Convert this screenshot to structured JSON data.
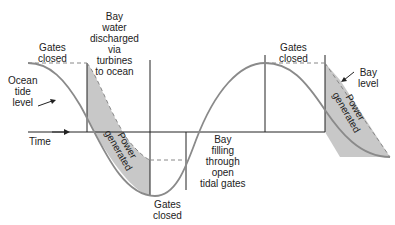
{
  "diagram": {
    "colors": {
      "curve": "#8a8a8a",
      "shading": "#c8c8c8",
      "lines": "#222222",
      "dashed": "#888888"
    },
    "labels": {
      "gates_closed_1": "Gates\nclosed",
      "bay_water": "Bay\nwater\ndischarged\nvia\nturbines\nto ocean",
      "gates_closed_2": "Gates\nclosed",
      "bay_level": "Bay\nlevel",
      "ocean_tide_level": "Ocean\ntide\nlevel",
      "time": "Time",
      "power_generated_1": "Power\ngenerated",
      "power_generated_2": "Power\ngenerated",
      "gates_closed_3": "Gates\nclosed",
      "bay_filling": "Bay\nfilling\nthrough\nopen\ntidal gates"
    }
  }
}
